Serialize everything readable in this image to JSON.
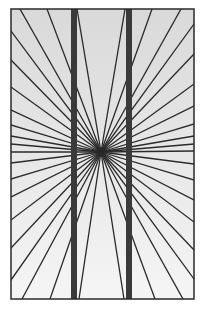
{
  "figure": {
    "frame": {
      "x": 11,
      "y": 9,
      "width": 183,
      "height": 290,
      "stroke": "#2a2a2a"
    },
    "background": {
      "top": "#d9d9d9",
      "bottom": "#f5f5f5"
    },
    "center": {
      "x": 101,
      "y": 152
    },
    "ray_color": "#2a2a2a",
    "ray_width": 1.3,
    "bands": [
      {
        "x": 71,
        "width": 6,
        "color": "#3a3a3a"
      },
      {
        "x": 126,
        "width": 6,
        "color": "#3a3a3a"
      }
    ],
    "ray_endpoints": [
      [
        20,
        9
      ],
      [
        47,
        9
      ],
      [
        77,
        9
      ],
      [
        125,
        9
      ],
      [
        152,
        9
      ],
      [
        181,
        9
      ],
      [
        11,
        31
      ],
      [
        11,
        60
      ],
      [
        11,
        87
      ],
      [
        11,
        110
      ],
      [
        11,
        125
      ],
      [
        11,
        136
      ],
      [
        11,
        144
      ],
      [
        11,
        152
      ],
      [
        11,
        163
      ],
      [
        11,
        179
      ],
      [
        11,
        197
      ],
      [
        11,
        220
      ],
      [
        11,
        248
      ],
      [
        11,
        280
      ],
      [
        194,
        24
      ],
      [
        194,
        54
      ],
      [
        194,
        84
      ],
      [
        194,
        106
      ],
      [
        194,
        124
      ],
      [
        194,
        136
      ],
      [
        194,
        144
      ],
      [
        194,
        151
      ],
      [
        194,
        164
      ],
      [
        194,
        180
      ],
      [
        194,
        200
      ],
      [
        194,
        222
      ],
      [
        194,
        250
      ],
      [
        194,
        279
      ],
      [
        22,
        299
      ],
      [
        50,
        299
      ],
      [
        79,
        299
      ],
      [
        124,
        299
      ],
      [
        155,
        299
      ],
      [
        183,
        299
      ]
    ]
  }
}
